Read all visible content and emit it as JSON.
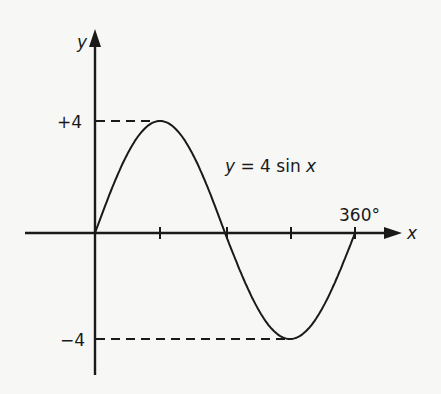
{
  "chart_data": {
    "type": "line",
    "title": "",
    "equation_label": "y = 4 sin x",
    "xlabel": "x",
    "ylabel": "y",
    "x_tick_label_end": "360°",
    "y_tick_labels": [
      "+4",
      "−4"
    ],
    "x": [
      0,
      90,
      180,
      270,
      360
    ],
    "series": [
      {
        "name": "y = 4 sin x",
        "values": [
          0,
          4,
          0,
          -4,
          0
        ]
      }
    ],
    "xlim": [
      0,
      360
    ],
    "ylim": [
      -4,
      4
    ],
    "grid": false,
    "dashed_guides": [
      {
        "y": 4,
        "x_to": 90
      },
      {
        "y": -4,
        "x_to": 270
      }
    ]
  },
  "labels": {
    "y_axis": "y",
    "x_axis": "x",
    "plus4": "+4",
    "minus4": "−4",
    "deg360": "360°",
    "eq_y": "y",
    "eq_rest": " = 4 sin ",
    "eq_x": "x"
  },
  "colors": {
    "ink": "#1a1a1a",
    "background": "#f7f7f5"
  }
}
